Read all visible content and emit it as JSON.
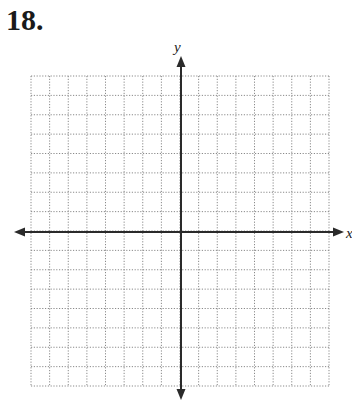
{
  "problem": {
    "number": "18."
  },
  "graph": {
    "x_label": "x",
    "y_label": "y",
    "grid_columns": 16,
    "grid_rows": 16,
    "grid_color": "#8a8a8a",
    "axis_color": "#2a2a2a"
  }
}
